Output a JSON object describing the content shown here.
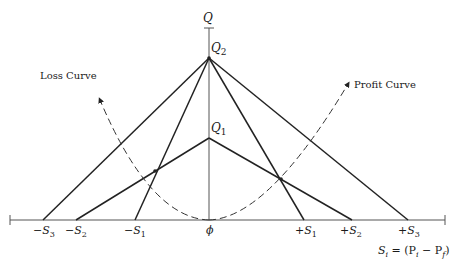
{
  "diagram": {
    "type": "line-diagram",
    "axes": {
      "vertical_label": "Q",
      "horizontal_label_formula": "S_i = (P_i − P_f)",
      "origin_label": "ϕ"
    },
    "points": {
      "Q2": "Q₂",
      "Q1": "Q₁"
    },
    "x_ticks": [
      "−S₃",
      "−S₂",
      "−S₁",
      "ϕ",
      "+S₁",
      "+S₂",
      "+S₃"
    ],
    "curves": {
      "loss": "Loss Curve",
      "profit": "Profit Curve"
    },
    "colors": {
      "line": "#222222",
      "axis": "#555555",
      "background": "#ffffff"
    }
  },
  "labels": {
    "q_axis": "Q",
    "q2": "Q",
    "q2_sub": "2",
    "q1": "Q",
    "q1_sub": "1",
    "loss_curve": "Loss Curve",
    "profit_curve": "Profit Curve",
    "neg_s3": "−S",
    "neg_s3_sub": "3",
    "neg_s2": "−S",
    "neg_s2_sub": "2",
    "neg_s1": "−S",
    "neg_s1_sub": "1",
    "origin": "ϕ",
    "pos_s1": "+S",
    "pos_s1_sub": "1",
    "pos_s2": "+S",
    "pos_s2_sub": "2",
    "pos_s3": "+S",
    "pos_s3_sub": "3",
    "formula_s": "S",
    "formula_i": "i",
    "formula_eq": " = (P",
    "formula_i2": "i",
    "formula_minus": " − P",
    "formula_f": "f",
    "formula_close": ")"
  }
}
